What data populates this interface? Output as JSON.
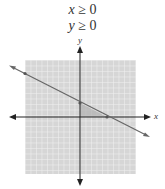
{
  "constraints": [
    {
      "var": "x",
      "op": "≥",
      "value": "0"
    },
    {
      "var": "y",
      "op": "≥",
      "value": "0"
    }
  ],
  "axes": {
    "x_label": "x",
    "y_label": "y"
  },
  "colors": {
    "grid_fill": "#d9d9d9",
    "grid_line": "#f0f0f0",
    "axis": "#222222",
    "boundary_line": "#666666",
    "feasible_region": "#b3b3b3"
  },
  "diagram": {
    "type": "linear-inequality-graph",
    "boundary_line": "line with negative slope crossing positive y-axis and positive x-axis",
    "shaded_region": "triangle in first quadrant below the line"
  }
}
